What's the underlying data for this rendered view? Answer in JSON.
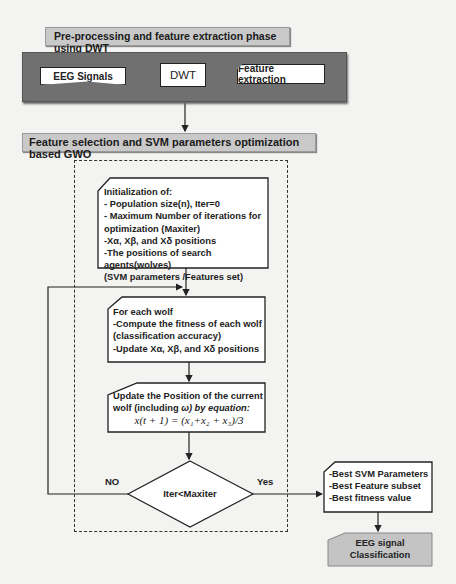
{
  "phase1": {
    "title": "Pre-processing and feature extraction phase using   DWT",
    "steps": [
      "EEG Signals",
      "DWT",
      "Feature extraction"
    ]
  },
  "phase2": {
    "title": "Feature selection and SVM parameters optimization  based GWO"
  },
  "init_box": {
    "lines": [
      "Initialization of:",
      "- Population size(n), Iter=0",
      "- Maximum Number of iterations for",
      "optimization (Maxiter)",
      "-Xα, Xβ, and Xδ positions",
      "-The positions of search agents(wolves)",
      " (SVM parameters /Features set)"
    ]
  },
  "wolf_box": {
    "lines": [
      "For each wolf",
      "-Compute the fitness of each wolf",
      "(classification accuracy)",
      "-Update Xα, Xβ, and Xδ positions"
    ]
  },
  "update_box": {
    "line1": "Update the Position of the   current",
    "line2_a": "wolf (including ",
    "line2_b": "ω) by equation:",
    "equation": "x(t + 1) = (x₁+x₂ + x₃)/3"
  },
  "decision": {
    "condition": "Iter<Maxiter",
    "no_label": "NO",
    "yes_label": "Yes"
  },
  "result_box": {
    "lines": [
      "-Best SVM Parameters",
      "-Best Feature subset",
      "-Best fitness value"
    ]
  },
  "final_box": {
    "lines": [
      "EEG signal",
      "Classification"
    ]
  },
  "colors": {
    "panel": "#707070",
    "title_bar": "#c9c9c9",
    "final_box": "#c4c4c4",
    "background": "#f3f3f1"
  }
}
